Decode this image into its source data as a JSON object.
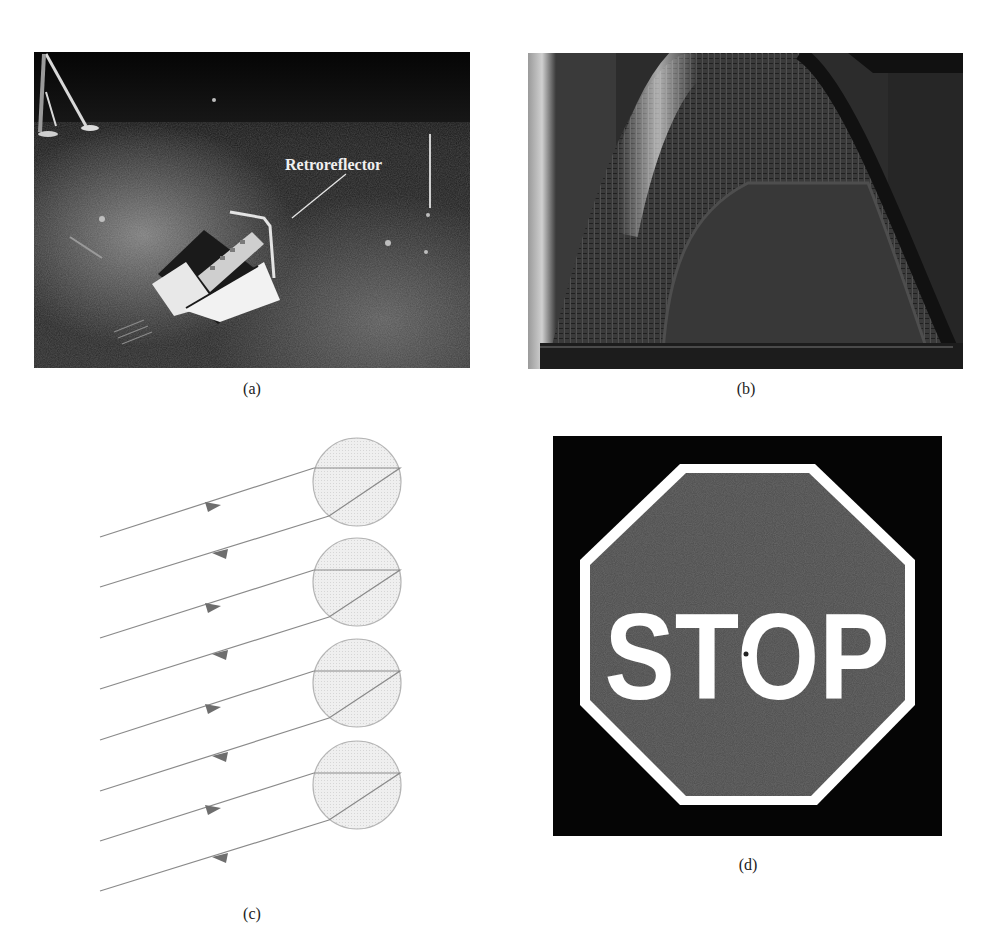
{
  "figure": {
    "panels": [
      {
        "id": "a",
        "caption": "(a)",
        "kind": "photo",
        "description": "Retroreflector array placed on the lunar surface",
        "annotation": "Retroreflector"
      },
      {
        "id": "b",
        "caption": "(b)",
        "kind": "photo",
        "description": "Close-up of a vehicle taillight lens with corner-cube retroreflector pattern"
      },
      {
        "id": "c",
        "caption": "(c)",
        "kind": "diagram",
        "description": "Light rays entering transparent spheres and reflecting back parallel to the incident direction",
        "sphere_count": 4,
        "ray_pairs": [
          {
            "incoming_arrow": "right",
            "outgoing_arrow": "left"
          },
          {
            "incoming_arrow": "right",
            "outgoing_arrow": "left"
          },
          {
            "incoming_arrow": "right",
            "outgoing_arrow": "left"
          },
          {
            "incoming_arrow": "right",
            "outgoing_arrow": "left"
          }
        ]
      },
      {
        "id": "d",
        "caption": "(d)",
        "kind": "photo",
        "description": "Retroreflective stop sign",
        "sign_text": "STOP"
      }
    ],
    "colors": {
      "background": "#ffffff",
      "caption_text": "#222222",
      "photo_dark": "#0b0b0b",
      "ray_line": "#8a8a8a",
      "arrow_fill": "#6e6e6e",
      "sphere_fill": "#ececec",
      "sphere_stroke": "#b5b5b5",
      "stop_bg": "#050505",
      "stop_face": "#4a4a4a",
      "stop_border": "#ffffff"
    }
  }
}
